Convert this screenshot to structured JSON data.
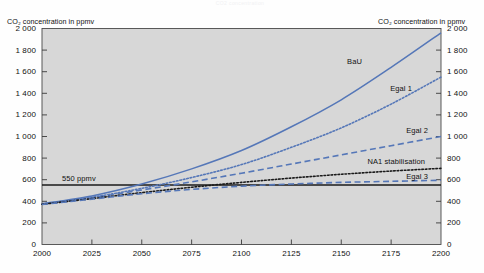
{
  "figure": {
    "faint_header": "CO2 concentration",
    "background": "#fefefe",
    "plot_background": "#d7d7d7",
    "accent_blue": "#5577b8",
    "accent_black": "#1a1a1a"
  },
  "axes": {
    "y_left_title": "CO₂ concentration in ppmv",
    "y_right_title": "CO₂ concentration in ppmv",
    "y_ticks": [
      "2 000",
      "1 800",
      "1 600",
      "1 400",
      "1 200",
      "1 000",
      "800",
      "600",
      "400",
      "200",
      "0"
    ],
    "y_tick_values": [
      2000,
      1800,
      1600,
      1400,
      1200,
      1000,
      800,
      600,
      400,
      200,
      0
    ],
    "x_ticks": [
      "2000",
      "2025",
      "2050",
      "2075",
      "2100",
      "2125",
      "2150",
      "2175",
      "2200"
    ],
    "x_tick_values": [
      2000,
      2025,
      2050,
      2075,
      2100,
      2125,
      2150,
      2175,
      2200
    ]
  },
  "annotations": {
    "threshold_label": "550 ppmv",
    "bau_label": "BaU",
    "egal1_label": "Egal 1",
    "egal2_label": "Egal 2",
    "na1_label": "NA1 stabilisation",
    "egal3_label": "Egal 3"
  },
  "chart_data": {
    "type": "line",
    "title": "",
    "xlabel": "",
    "ylabel": "CO₂ concentration in ppmv",
    "xlim": [
      2000,
      2200
    ],
    "ylim": [
      0,
      2000
    ],
    "grid": false,
    "legend": "inline-annotations",
    "x": [
      2000,
      2025,
      2050,
      2075,
      2100,
      2125,
      2150,
      2175,
      2200
    ],
    "series": [
      {
        "name": "BaU",
        "style": "solid",
        "color": "#5577b8",
        "values": [
          378,
          450,
          560,
          700,
          870,
          1090,
          1340,
          1640,
          1960
        ]
      },
      {
        "name": "Egal 1",
        "style": "dotted",
        "color": "#5577b8",
        "values": [
          375,
          437,
          520,
          620,
          740,
          900,
          1080,
          1300,
          1550
        ]
      },
      {
        "name": "Egal 2",
        "style": "dashed",
        "color": "#5577b8",
        "values": [
          373,
          432,
          505,
          580,
          660,
          745,
          830,
          915,
          1000
        ]
      },
      {
        "name": "NA1 stabilisation",
        "style": "dotted",
        "color": "#1a1a1a",
        "values": [
          372,
          425,
          480,
          530,
          575,
          615,
          650,
          680,
          705
        ]
      },
      {
        "name": "Egal 3",
        "style": "dashed",
        "color": "#5577b8",
        "values": [
          370,
          420,
          470,
          510,
          540,
          560,
          575,
          585,
          595
        ]
      }
    ],
    "reference_lines": [
      {
        "name": "550 ppmv",
        "orientation": "horizontal",
        "value": 550,
        "color": "#1a1a1a",
        "style": "solid"
      }
    ]
  }
}
